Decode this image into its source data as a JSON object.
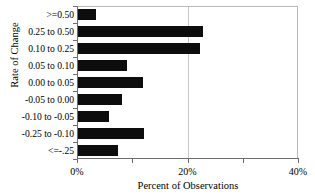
{
  "chart_data": {
    "type": "bar",
    "orientation": "horizontal",
    "title": "",
    "xlabel": "Percent of Observations",
    "ylabel": "Rate of Change",
    "categories": [
      ">=0.50",
      "0.25 to 0.50",
      "0.10 to 0.25",
      "0.05 to 0.10",
      "0.00 to 0.05",
      "-0.05 to 0.00",
      "-0.10 to -0.05",
      "-0.25 to -0.10",
      "<=-.25"
    ],
    "values": [
      3.5,
      22.8,
      22.2,
      9.0,
      11.9,
      8.1,
      5.8,
      12.1,
      7.4
    ],
    "xlim": [
      0,
      40
    ],
    "xticks": [
      0,
      20,
      40
    ],
    "xtick_labels": [
      "0%",
      "20%",
      "40%"
    ],
    "xminor_ticks": [
      10,
      30
    ],
    "grid": "vertical-at-major-ticks",
    "legend": "none",
    "bar_color": "#0d0d0d",
    "axis_color": "#6d6d6d",
    "grid_color": "#c8c8c8",
    "background": "#ffffff"
  }
}
